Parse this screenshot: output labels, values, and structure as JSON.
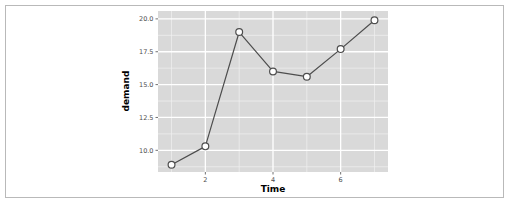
{
  "figure": {
    "background": "#ffffff",
    "frame_color": "#b9b9b9"
  },
  "chart_data": {
    "type": "line",
    "title": "",
    "xlabel": "Time",
    "ylabel": "demand",
    "x": [
      1,
      2,
      3,
      4,
      5,
      6,
      7
    ],
    "values": [
      8.9,
      10.3,
      19.0,
      16.0,
      15.6,
      17.7,
      19.9
    ],
    "series": [
      {
        "name": "demand",
        "x": [
          1,
          2,
          3,
          4,
          5,
          6,
          7
        ],
        "values": [
          8.9,
          10.3,
          19.0,
          16.0,
          15.6,
          17.7,
          19.9
        ]
      }
    ],
    "xlim": [
      0.6,
      7.4
    ],
    "ylim": [
      8.35,
      20.6
    ],
    "xticks": [
      2,
      4,
      6
    ],
    "xticklabels": [
      "2",
      "4",
      "6"
    ],
    "yticks": [
      10.0,
      12.5,
      15.0,
      17.5,
      20.0
    ],
    "yticklabels": [
      "10.0",
      "12.5",
      "15.0",
      "17.5",
      "20.0"
    ],
    "grid": true,
    "grid_major_color": "#ffffff",
    "grid_minor_color": "#f2f2f2",
    "panel_background": "#d9d9d9",
    "line_color": "#4d4d4d",
    "point_fill": "#ffffff",
    "point_stroke": "#4d4d4d",
    "legend": "none",
    "markers": "circle"
  },
  "axes": {
    "y_title": "demand",
    "x_title": "Time",
    "y_tick_0": "10.0",
    "y_tick_1": "12.5",
    "y_tick_2": "15.0",
    "y_tick_3": "17.5",
    "y_tick_4": "20.0",
    "x_tick_0": "2",
    "x_tick_1": "4",
    "x_tick_2": "6"
  }
}
